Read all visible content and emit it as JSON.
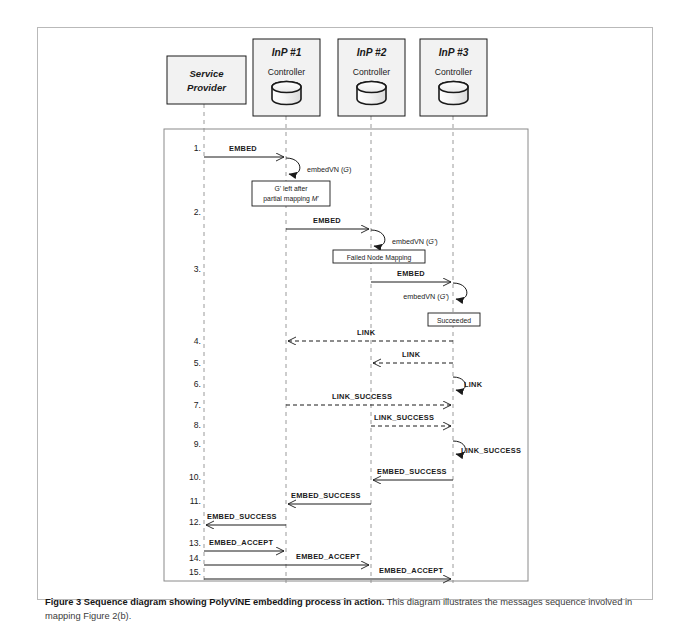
{
  "figure": {
    "caption_bold": "Figure 3 Sequence diagram showing PolyViNE embedding process in action.",
    "caption_rest": " This diagram illustrates the messages sequence involved in mapping Figure 2(b)."
  },
  "lifelines": [
    {
      "id": "sp",
      "title": "Service",
      "title2": "Provider",
      "sub": "",
      "x": 203,
      "type": "actor"
    },
    {
      "id": "inp1",
      "title": "InP #1",
      "sub": "Controller",
      "x": 285,
      "type": "controller"
    },
    {
      "id": "inp2",
      "title": "InP #2",
      "sub": "Controller",
      "x": 370,
      "type": "controller"
    },
    {
      "id": "inp3",
      "title": "InP #3",
      "sub": "Controller",
      "x": 452,
      "type": "controller"
    }
  ],
  "steps": [
    {
      "n": "1.",
      "y": 147
    },
    {
      "n": "2.",
      "y": 211
    },
    {
      "n": "3.",
      "y": 268
    },
    {
      "n": "4.",
      "y": 340
    },
    {
      "n": "5.",
      "y": 362
    },
    {
      "n": "6.",
      "y": 383
    },
    {
      "n": "7.",
      "y": 404
    },
    {
      "n": "8.",
      "y": 424
    },
    {
      "n": "9.",
      "y": 443
    },
    {
      "n": "10.",
      "y": 476
    },
    {
      "n": "11.",
      "y": 500
    },
    {
      "n": "12.",
      "y": 521
    },
    {
      "n": "13.",
      "y": 542
    },
    {
      "n": "14.",
      "y": 557
    },
    {
      "n": "15.",
      "y": 571
    }
  ],
  "messages": [
    {
      "label": "EMBED",
      "from": 203,
      "to": 285,
      "y": 156,
      "style": "solid",
      "dir": "right",
      "label_x": 228,
      "label_y": 150
    },
    {
      "label": "EMBED",
      "from": 285,
      "to": 370,
      "y": 228,
      "style": "solid",
      "dir": "right",
      "label_x": 312,
      "label_y": 221
    },
    {
      "label": "EMBED",
      "from": 370,
      "to": 452,
      "y": 281,
      "style": "solid",
      "dir": "right",
      "label_x": 396,
      "label_y": 274
    },
    {
      "label": "LINK",
      "from": 452,
      "to": 285,
      "y": 340,
      "style": "dashed",
      "dir": "left",
      "label_x": 358,
      "label_y": 334
    },
    {
      "label": "LINK",
      "from": 452,
      "to": 370,
      "y": 362,
      "style": "dashed",
      "dir": "left",
      "label_x": 401,
      "label_y": 356
    },
    {
      "label": "LINK_SUCCESS",
      "from": 285,
      "to": 452,
      "y": 404,
      "style": "dashed",
      "dir": "right",
      "label_x": 333,
      "label_y": 398
    },
    {
      "label": "LINK_SUCCESS",
      "from": 370,
      "to": 452,
      "y": 425,
      "style": "dashed",
      "dir": "right",
      "label_x": 375,
      "label_y": 419
    },
    {
      "label": "EMBED_SUCCESS",
      "from": 452,
      "to": 370,
      "y": 479,
      "style": "solid",
      "dir": "left",
      "label_x": 376,
      "label_y": 473
    },
    {
      "label": "EMBED_SUCCESS",
      "from": 370,
      "to": 285,
      "y": 503,
      "style": "solid",
      "dir": "left",
      "label_x": 290,
      "label_y": 497
    },
    {
      "label": "EMBED_SUCCESS",
      "from": 285,
      "to": 203,
      "y": 524,
      "style": "solid",
      "dir": "left",
      "label_x": 206,
      "label_y": 518
    },
    {
      "label": "EMBED_ACCEPT",
      "from": 203,
      "to": 285,
      "y": 550,
      "style": "solid",
      "dir": "right",
      "label_x": 208,
      "label_y": 543
    },
    {
      "label": "EMBED_ACCEPT",
      "from": 203,
      "to": 370,
      "y": 564,
      "style": "solid",
      "dir": "right",
      "label_x": 295,
      "label_y": 558
    },
    {
      "label": "EMBED_ACCEPT",
      "from": 203,
      "to": 452,
      "y": 578,
      "style": "solid",
      "dir": "right",
      "label_x": 378,
      "label_y": 572
    }
  ],
  "self_calls": [
    {
      "label": "embedVN (",
      "arg": "G",
      "close": ")",
      "x": 285,
      "y": 157,
      "label_x": 305,
      "label_y": 172
    },
    {
      "label": "embedVN (",
      "arg": "G'",
      "close": ")",
      "x": 370,
      "y": 229,
      "label_x": 390,
      "label_y": 244
    },
    {
      "label": "embedVN (",
      "arg": "G'",
      "close": ")",
      "x": 452,
      "y": 282,
      "label_x": 388,
      "label_y": 299,
      "anchor": "end"
    }
  ],
  "notes": [
    {
      "lines": [
        "G' left after",
        "partial mapping M'"
      ],
      "x": 290,
      "y": 180,
      "w": 78,
      "h": 25,
      "italic_tail": true
    },
    {
      "lines": [
        "Failed Node Mapping"
      ],
      "x": 332,
      "y": 249,
      "w": 92,
      "h": 14
    },
    {
      "lines": [
        "Succeeded"
      ],
      "x": 427,
      "y": 312,
      "w": 52,
      "h": 14
    }
  ],
  "colors": {
    "stroke": "#1a1a1a",
    "lifeline": "#8c8c8c",
    "header_fill": "#f2f2f2",
    "frame": "#7a7a7a",
    "card_border": "#b9b9b9"
  }
}
